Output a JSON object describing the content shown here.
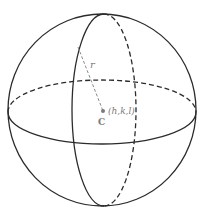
{
  "diagram": {
    "labels": {
      "radius": "r",
      "center_coords": "(h,k,l)",
      "center_name": "C"
    },
    "colors": {
      "stroke": "#2b2b2b",
      "label": "#7a7a7a",
      "background": "#ffffff"
    },
    "geometry": {
      "sphere": {
        "cx": 102,
        "cy": 110,
        "rx": 94,
        "ry": 96
      },
      "equator": {
        "cx": 102,
        "cy": 112,
        "rx": 94,
        "ry": 32
      },
      "meridian": {
        "cx": 104,
        "cy": 110,
        "rx": 32,
        "ry": 96
      },
      "radius_line": {
        "x1": 78,
        "y1": 47,
        "x2": 103,
        "y2": 111
      },
      "center_dot": {
        "cx": 103,
        "cy": 111
      }
    }
  }
}
